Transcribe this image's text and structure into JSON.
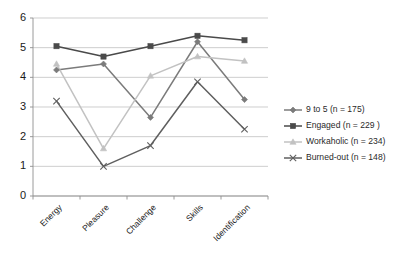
{
  "chart_data": {
    "type": "line",
    "title": "",
    "xlabel": "",
    "ylabel": "",
    "categories": [
      "Energy",
      "Pleasure",
      "Challenge",
      "Skills",
      "Identification"
    ],
    "ylim": [
      0,
      6
    ],
    "yticks": [
      0,
      1,
      2,
      3,
      4,
      5,
      6
    ],
    "grid": true,
    "legend_position": "right",
    "series": [
      {
        "name": "9 to 5 (n = 175)",
        "marker": "diamond",
        "color": "#7b7b7b",
        "values": [
          4.25,
          4.45,
          2.65,
          5.2,
          3.25
        ]
      },
      {
        "name": "Engaged  (n = 229 )",
        "marker": "square",
        "color": "#4a4a4a",
        "values": [
          5.05,
          4.7,
          5.05,
          5.4,
          5.25
        ]
      },
      {
        "name": "Workaholic  (n = 234)",
        "marker": "triangle",
        "color": "#c2c2c2",
        "values": [
          4.45,
          1.6,
          4.05,
          4.7,
          4.55
        ]
      },
      {
        "name": "Burned-out  (n = 148)",
        "marker": "cross",
        "color": "#5f5f5f",
        "values": [
          3.2,
          1.0,
          1.7,
          3.85,
          2.25
        ]
      }
    ]
  },
  "axis": {
    "ytick_labels": [
      "6",
      "5",
      "4",
      "3",
      "2",
      "1",
      "0"
    ]
  },
  "legend": {
    "items": [
      {
        "label": "9 to 5 (n = 175)"
      },
      {
        "label": "Engaged  (n = 229 )"
      },
      {
        "label": "Workaholic  (n = 234)"
      },
      {
        "label": "Burned-out  (n = 148)"
      }
    ]
  }
}
